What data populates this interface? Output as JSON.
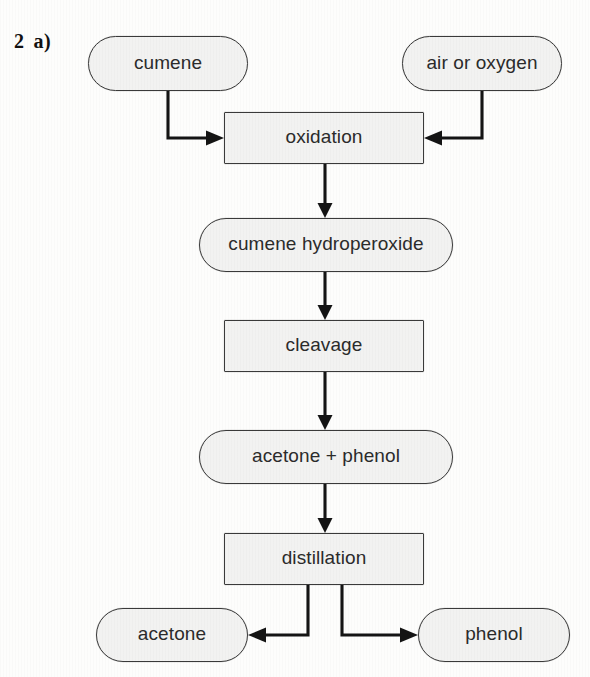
{
  "question": {
    "number": "2",
    "part": "a)"
  },
  "diagram": {
    "type": "flowchart",
    "nodes": [
      {
        "id": "cumene",
        "label": "cumene",
        "shape": "terminal",
        "x": 88,
        "y": 36,
        "w": 160,
        "h": 55
      },
      {
        "id": "air_or_oxygen",
        "label": "air or oxygen",
        "shape": "terminal",
        "x": 402,
        "y": 36,
        "w": 160,
        "h": 55
      },
      {
        "id": "oxidation",
        "label": "oxidation",
        "shape": "process",
        "x": 224,
        "y": 112,
        "w": 200,
        "h": 52
      },
      {
        "id": "cumene_hydroperoxide",
        "label": "cumene hydroperoxide",
        "shape": "terminal",
        "x": 199,
        "y": 218,
        "w": 254,
        "h": 54
      },
      {
        "id": "cleavage",
        "label": "cleavage",
        "shape": "process",
        "x": 224,
        "y": 320,
        "w": 200,
        "h": 52
      },
      {
        "id": "acetone_plus_phenol",
        "label": "acetone + phenol",
        "shape": "terminal",
        "x": 199,
        "y": 430,
        "w": 254,
        "h": 54
      },
      {
        "id": "distillation",
        "label": "distillation",
        "shape": "process",
        "x": 224,
        "y": 533,
        "w": 200,
        "h": 52
      },
      {
        "id": "acetone",
        "label": "acetone",
        "shape": "terminal",
        "x": 96,
        "y": 608,
        "w": 152,
        "h": 54
      },
      {
        "id": "phenol",
        "label": "phenol",
        "shape": "terminal",
        "x": 418,
        "y": 608,
        "w": 152,
        "h": 54
      }
    ],
    "edges": [
      {
        "from": "cumene",
        "to": "oxidation",
        "style": "elbow-down-right"
      },
      {
        "from": "air_or_oxygen",
        "to": "oxidation",
        "style": "elbow-down-left"
      },
      {
        "from": "oxidation",
        "to": "cumene_hydroperoxide",
        "style": "straight-down"
      },
      {
        "from": "cumene_hydroperoxide",
        "to": "cleavage",
        "style": "straight-down"
      },
      {
        "from": "cleavage",
        "to": "acetone_plus_phenol",
        "style": "straight-down"
      },
      {
        "from": "acetone_plus_phenol",
        "to": "distillation",
        "style": "straight-down"
      },
      {
        "from": "distillation",
        "to": "acetone",
        "style": "elbow-down-left"
      },
      {
        "from": "distillation",
        "to": "phenol",
        "style": "elbow-down-right"
      }
    ]
  },
  "colors": {
    "node_fill": "#f2f2f1",
    "node_border": "#3a3a3a",
    "wire": "#141414",
    "text": "#2b2b2b",
    "page_background": "#fdfdfc"
  }
}
